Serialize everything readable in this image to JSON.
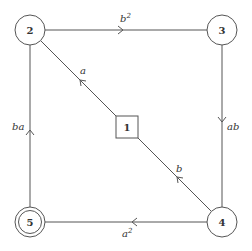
{
  "diagram": {
    "type": "state-transition-graph",
    "nodes": [
      {
        "id": "1",
        "label": "1",
        "shape": "square",
        "x": 127,
        "y": 127
      },
      {
        "id": "2",
        "label": "2",
        "shape": "circle",
        "x": 30,
        "y": 30
      },
      {
        "id": "3",
        "label": "3",
        "shape": "circle",
        "x": 222,
        "y": 30
      },
      {
        "id": "4",
        "label": "4",
        "shape": "circle",
        "x": 222,
        "y": 222
      },
      {
        "id": "5",
        "label": "5",
        "shape": "double-circle",
        "x": 30,
        "y": 222
      }
    ],
    "edges": [
      {
        "from": "2",
        "to": "3",
        "label_base": "b",
        "label_sup": "2"
      },
      {
        "from": "3",
        "to": "4",
        "label_base": "ab",
        "label_sup": ""
      },
      {
        "from": "4",
        "to": "5",
        "label_base": "a",
        "label_sup": "2"
      },
      {
        "from": "5",
        "to": "2",
        "label_base": "ba",
        "label_sup": ""
      },
      {
        "from": "1",
        "to": "2",
        "label_base": "a",
        "label_sup": ""
      },
      {
        "from": "4",
        "to": "1",
        "label_base": "b",
        "label_sup": ""
      }
    ],
    "colors": {
      "stroke": "#555555",
      "text": "#333333",
      "background": "#ffffff"
    }
  }
}
